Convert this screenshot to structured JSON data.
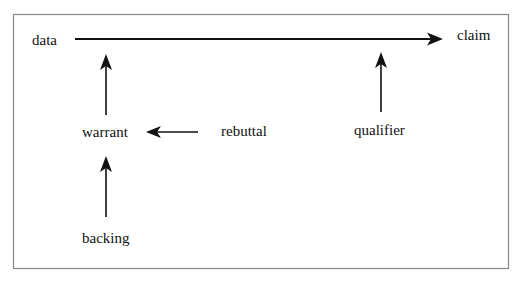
{
  "diagram": {
    "type": "toulmin-argument-model",
    "nodes": {
      "data": "data",
      "claim": "claim",
      "warrant": "warrant",
      "rebuttal": "rebuttal",
      "qualifier": "qualifier",
      "backing": "backing"
    },
    "edges": [
      {
        "from": "data",
        "to": "claim"
      },
      {
        "from": "warrant",
        "to": "data-claim-line"
      },
      {
        "from": "rebuttal",
        "to": "warrant"
      },
      {
        "from": "qualifier",
        "to": "data-claim-line"
      },
      {
        "from": "backing",
        "to": "warrant"
      }
    ],
    "colors": {
      "ink": "#111111",
      "frame": "#888888",
      "background": "#ffffff"
    }
  }
}
